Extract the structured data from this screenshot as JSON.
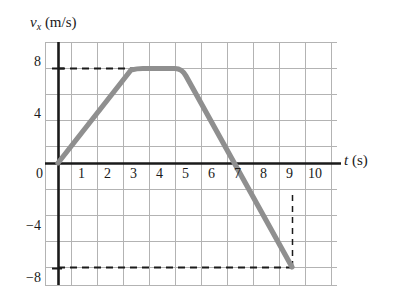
{
  "figure": {
    "type": "velocity-time-graph",
    "y_axis_label_prefix": "v",
    "y_axis_label_sub": "x",
    "y_axis_label_unit": " (m/s)",
    "x_axis_label_prefix": "t",
    "x_axis_label_unit": " (s)",
    "curve_color": "#8f8f8f",
    "grid_color": "#b3b3b3",
    "axis_color": "#1a1a1a",
    "dash_color": "#1a1a1a"
  },
  "chart_data": {
    "type": "line",
    "title": "",
    "xlabel": "t (s)",
    "ylabel": "v_x (m/s)",
    "xlim": [
      -0.5,
      10.7
    ],
    "ylim": [
      -10,
      10
    ],
    "grid": true,
    "legend": "none",
    "x_ticks": [
      0,
      1,
      2,
      3,
      4,
      5,
      6,
      7,
      8,
      9,
      10
    ],
    "x_tick_labels": [
      "0",
      "1",
      "2",
      "3",
      "4",
      "5",
      "6",
      "7",
      "8",
      "9",
      "10"
    ],
    "y_ticks": [
      8,
      4,
      0,
      -4,
      -8
    ],
    "y_tick_labels": [
      "8",
      "4",
      "0",
      "-4",
      "-8"
    ],
    "x_minor_step": 1,
    "y_minor_step": 2,
    "series": [
      {
        "name": "v_x",
        "x": [
          0,
          3,
          5,
          9
        ],
        "values": [
          0,
          8,
          8,
          -8
        ]
      }
    ],
    "annotations": [
      {
        "kind": "dashed-horizontal",
        "y": 8,
        "x_from": 0,
        "x_to": 3
      },
      {
        "kind": "dashed-horizontal",
        "y": -8,
        "x_from": 0,
        "x_to": 9
      },
      {
        "kind": "dashed-vertical",
        "x": 9,
        "y_from": -8,
        "y_to": 0
      }
    ],
    "key_points": [
      {
        "t": 0,
        "v": 0
      },
      {
        "t": 3,
        "v": 8
      },
      {
        "t": 5,
        "v": 8
      },
      {
        "t": 7,
        "v": 0
      },
      {
        "t": 9,
        "v": -8
      }
    ]
  },
  "y_tick_items": [
    {
      "label": "8",
      "left": 34,
      "top": 54
    },
    {
      "label": "4",
      "left": 34,
      "top": 106
    },
    {
      "label": "0",
      "left": 36,
      "top": 166
    },
    {
      "label": "−4",
      "left": 26,
      "top": 218
    },
    {
      "label": "−8",
      "left": 26,
      "top": 270
    }
  ],
  "x_tick_items": [
    {
      "label": "1",
      "left": 78,
      "top": 166
    },
    {
      "label": "2",
      "left": 104,
      "top": 166
    },
    {
      "label": "3",
      "left": 130,
      "top": 166
    },
    {
      "label": "4",
      "left": 156,
      "top": 166
    },
    {
      "label": "5",
      "left": 182,
      "top": 166
    },
    {
      "label": "6",
      "left": 208,
      "top": 166
    },
    {
      "label": "7",
      "left": 234,
      "top": 166
    },
    {
      "label": "8",
      "left": 260,
      "top": 166
    },
    {
      "label": "9",
      "left": 286,
      "top": 166
    },
    {
      "label": "10",
      "left": 308,
      "top": 166
    }
  ]
}
